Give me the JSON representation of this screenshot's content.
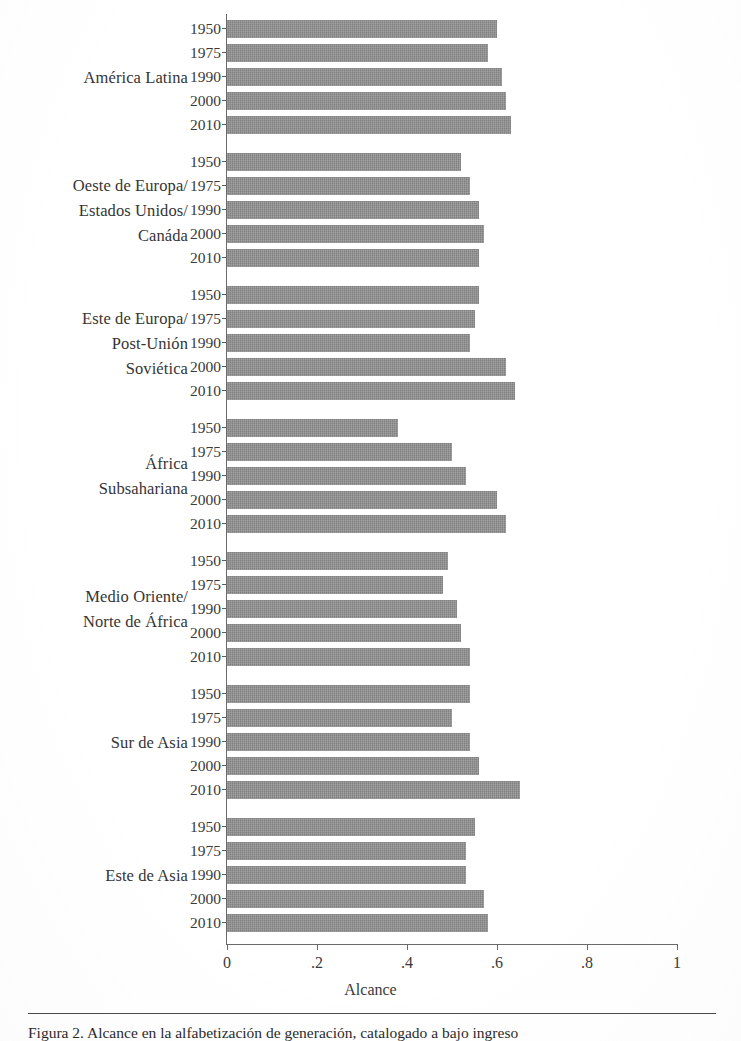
{
  "figure": {
    "caption": "Figura 2. Alcance en la alfabetización de generación, catalogado a bajo ingreso",
    "bar_color": "#8c8c8c",
    "axis_color": "#6a6a6a"
  },
  "chart_data": {
    "type": "bar",
    "orientation": "horizontal",
    "title": "",
    "xlabel": "Alcance",
    "ylabel": "",
    "xlim": [
      0,
      1.08
    ],
    "xticks": [
      0,
      0.2,
      0.4,
      0.6,
      0.8,
      1
    ],
    "xticklabels": [
      "0",
      ".2",
      ".4",
      ".6",
      ".8",
      "1"
    ],
    "grid": false,
    "legend": null,
    "categories": [
      "1950",
      "1975",
      "1990",
      "2000",
      "2010"
    ],
    "groups": [
      {
        "label": "América Latina",
        "label_lines": [
          "América Latina"
        ],
        "values": [
          0.6,
          0.58,
          0.61,
          0.62,
          0.63
        ]
      },
      {
        "label": "Oeste de Europa/ Estados Unidos/ Canáda",
        "label_lines": [
          "Oeste de Europa/",
          "Estados Unidos/",
          "Canáda"
        ],
        "values": [
          0.52,
          0.54,
          0.56,
          0.57,
          0.56
        ]
      },
      {
        "label": "Este de Europa/ Post-Unión Soviética",
        "label_lines": [
          "Este de Europa/",
          "Post-Unión",
          "Soviética"
        ],
        "values": [
          0.56,
          0.55,
          0.54,
          0.62,
          0.64
        ]
      },
      {
        "label": "África Subsahariana",
        "label_lines": [
          "África",
          "Subsahariana"
        ],
        "values": [
          0.38,
          0.5,
          0.53,
          0.6,
          0.62
        ]
      },
      {
        "label": "Medio Oriente/ Norte de África",
        "label_lines": [
          "Medio Oriente/",
          "Norte de África"
        ],
        "values": [
          0.49,
          0.48,
          0.51,
          0.52,
          0.54
        ]
      },
      {
        "label": "Sur de Asia",
        "label_lines": [
          "Sur de Asia"
        ],
        "values": [
          0.54,
          0.5,
          0.54,
          0.56,
          0.65
        ]
      },
      {
        "label": "Este de Asia",
        "label_lines": [
          "Este de Asia"
        ],
        "values": [
          0.55,
          0.53,
          0.53,
          0.57,
          0.58
        ]
      }
    ]
  }
}
